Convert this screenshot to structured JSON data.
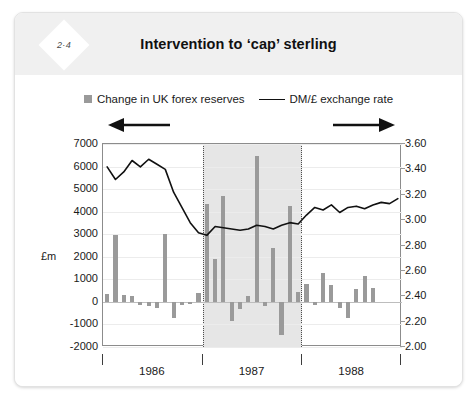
{
  "card": {
    "badge": "2·4",
    "title": "Intervention to ‘cap’ sterling"
  },
  "legend": {
    "bars_label": "Change in UK forex reserves",
    "line_label": "DM/£ exchange rate",
    "bar_color": "#9a9a9a",
    "line_color": "#111111"
  },
  "axes": {
    "left_unit": "£m",
    "left_ticks": [
      "7000",
      "6000",
      "5000",
      "4000",
      "3000",
      "2000",
      "1000",
      "0",
      "-1000",
      "-2000"
    ],
    "right_ticks": [
      "3.60",
      "3.40",
      "3.20",
      "3.00",
      "2.80",
      "2.60",
      "2.40",
      "2.20",
      "2.00"
    ],
    "x_ticks": [
      "1986",
      "1987",
      "1988"
    ],
    "left_arrow": "left-arrow-icon",
    "right_arrow": "right-arrow-icon"
  },
  "chart_data": {
    "type": "bar",
    "title": "Intervention to ‘cap’ sterling",
    "subtitle": "",
    "xlabel": "",
    "ylabel": "£m",
    "y2label": "DM/£ exchange rate",
    "ylim": [
      -2000,
      7000
    ],
    "y2lim": [
      2.0,
      3.6
    ],
    "grid": true,
    "legend_position": "top-center",
    "x": [
      "1986-01",
      "1986-02",
      "1986-03",
      "1986-04",
      "1986-05",
      "1986-06",
      "1986-07",
      "1986-08",
      "1986-09",
      "1986-10",
      "1986-11",
      "1986-12",
      "1987-01",
      "1987-02",
      "1987-03",
      "1987-04",
      "1987-05",
      "1987-06",
      "1987-07",
      "1987-08",
      "1987-09",
      "1987-10",
      "1987-11",
      "1987-12",
      "1988-01",
      "1988-02",
      "1988-03",
      "1988-04",
      "1988-05",
      "1988-06",
      "1988-07",
      "1988-08",
      "1988-09",
      "1988-10",
      "1988-11",
      "1988-12"
    ],
    "categories": [
      "1986-01",
      "1986-02",
      "1986-03",
      "1986-04",
      "1986-05",
      "1986-06",
      "1986-07",
      "1986-08",
      "1986-09",
      "1986-10",
      "1986-11",
      "1986-12",
      "1987-01",
      "1987-02",
      "1987-03",
      "1987-04",
      "1987-05",
      "1987-06",
      "1987-07",
      "1987-08",
      "1987-09",
      "1987-10",
      "1987-11",
      "1987-12",
      "1988-01",
      "1988-02",
      "1988-03",
      "1988-04",
      "1988-05",
      "1988-06",
      "1988-07",
      "1988-08",
      "1988-09",
      "1988-10",
      "1988-11",
      "1988-12"
    ],
    "series": [
      {
        "name": "Change in UK forex reserves",
        "type": "bar",
        "axis": "left",
        "unit": "£m",
        "color": "#9a9a9a",
        "values": [
          350,
          2950,
          300,
          250,
          -120,
          -180,
          -250,
          3000,
          -700,
          -130,
          -90,
          380,
          4350,
          1900,
          4700,
          -850,
          -300,
          250,
          6450,
          -200,
          2400,
          -1450,
          4250,
          450,
          800,
          -150,
          1300,
          750,
          -250,
          -700,
          550,
          1150,
          600,
          0,
          0,
          0
        ]
      },
      {
        "name": "DM/£ exchange rate",
        "type": "line",
        "axis": "right",
        "color": "#111111",
        "values": [
          3.42,
          3.32,
          3.38,
          3.47,
          3.42,
          3.48,
          3.44,
          3.4,
          3.22,
          3.1,
          2.98,
          2.9,
          2.88,
          2.95,
          2.94,
          2.93,
          2.92,
          2.93,
          2.96,
          2.95,
          2.93,
          2.96,
          2.98,
          2.97,
          3.04,
          3.1,
          3.08,
          3.12,
          3.06,
          3.1,
          3.11,
          3.09,
          3.12,
          3.14,
          3.13,
          3.17
        ]
      }
    ],
    "annotations": [
      {
        "type": "shaded-band",
        "label": "intervention period",
        "x_start": "1987-01",
        "x_end": "1988-01",
        "color": "#e6e6e6"
      }
    ]
  }
}
